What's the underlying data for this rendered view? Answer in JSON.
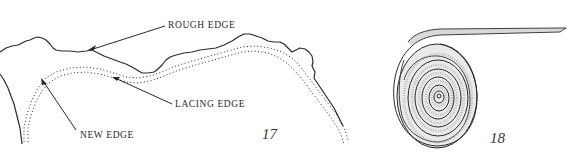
{
  "figures": [
    {
      "number": "17",
      "labels": {
        "rough_edge": "ROUGH EDGE",
        "lacing_edge": "LACING EDGE",
        "new_edge": "NEW EDGE"
      }
    },
    {
      "number": "18"
    }
  ],
  "colors": {
    "ink": "#2a2a2a",
    "background": "#ffffff",
    "shading": "#8a8a8a"
  }
}
